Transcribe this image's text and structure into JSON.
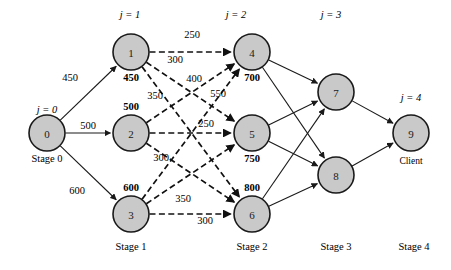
{
  "diagram": {
    "type": "network-flow-graph",
    "background_color": "#ffffff",
    "node_fill_color": "#c9c9c9",
    "node_stroke_color": "#1a1a1a",
    "edge_color": "#111111",
    "stage_headers": [
      {
        "id": "j0",
        "text": "j = 0",
        "x": 47,
        "y": 113
      },
      {
        "id": "j1",
        "text": "j = 1",
        "x": 130,
        "y": 18
      },
      {
        "id": "j2",
        "text": "j = 2",
        "x": 236,
        "y": 18
      },
      {
        "id": "j3",
        "text": "j = 3",
        "x": 331,
        "y": 18
      },
      {
        "id": "j4",
        "text": "j = 4",
        "x": 411,
        "y": 101
      }
    ],
    "stage_footers": [
      {
        "id": "stage0",
        "text": "Stage 0",
        "x": 47,
        "y": 162
      },
      {
        "id": "stage1",
        "text": "Stage 1",
        "x": 131,
        "y": 250
      },
      {
        "id": "stage2",
        "text": "Stage 2",
        "x": 252,
        "y": 250
      },
      {
        "id": "stage3",
        "text": "Stage 3",
        "x": 336,
        "y": 250
      },
      {
        "id": "stage4",
        "text": "Stage 4",
        "x": 414,
        "y": 250
      }
    ],
    "client_label": {
      "text": "Client",
      "x": 411,
      "y": 164
    },
    "nodes": [
      {
        "id": "n0",
        "label": "0",
        "x": 47,
        "y": 133,
        "r": 18,
        "value": null,
        "value_pos": null
      },
      {
        "id": "n1",
        "label": "1",
        "x": 131,
        "y": 52,
        "r": 18,
        "value": "450",
        "value_pos": "below"
      },
      {
        "id": "n2",
        "label": "2",
        "x": 131,
        "y": 133,
        "r": 18,
        "value": "500",
        "value_pos": "above"
      },
      {
        "id": "n3",
        "label": "3",
        "x": 131,
        "y": 214,
        "r": 18,
        "value": "600",
        "value_pos": "above"
      },
      {
        "id": "n4",
        "label": "4",
        "x": 252,
        "y": 52,
        "r": 18,
        "value": "700",
        "value_pos": "below"
      },
      {
        "id": "n5",
        "label": "5",
        "x": 252,
        "y": 133,
        "r": 18,
        "value": "750",
        "value_pos": "below"
      },
      {
        "id": "n6",
        "label": "6",
        "x": 252,
        "y": 214,
        "r": 18,
        "value": "800",
        "value_pos": "above"
      },
      {
        "id": "n7",
        "label": "7",
        "x": 336,
        "y": 92,
        "r": 18,
        "value": null,
        "value_pos": null
      },
      {
        "id": "n8",
        "label": "8",
        "x": 336,
        "y": 175,
        "r": 18,
        "value": null,
        "value_pos": null
      },
      {
        "id": "n9",
        "label": "9",
        "x": 411,
        "y": 133,
        "r": 18,
        "value": null,
        "value_pos": null
      }
    ],
    "edges": [
      {
        "id": "e0-1",
        "from": "n0",
        "to": "n1",
        "style": "solid",
        "weight": "450",
        "label_x": 70,
        "label_y": 81
      },
      {
        "id": "e0-2",
        "from": "n0",
        "to": "n2",
        "style": "solid",
        "weight": "500",
        "label_x": 88,
        "label_y": 129
      },
      {
        "id": "e0-3",
        "from": "n0",
        "to": "n3",
        "style": "solid",
        "weight": "600",
        "label_x": 77,
        "label_y": 194
      },
      {
        "id": "e1-4",
        "from": "n1",
        "to": "n4",
        "style": "dashed",
        "weight": "250",
        "label_x": 192,
        "label_y": 38
      },
      {
        "id": "e1-5",
        "from": "n1",
        "to": "n5",
        "style": "dashed",
        "weight": "300",
        "label_x": 175,
        "label_y": 63
      },
      {
        "id": "e1-6",
        "from": "n1",
        "to": "n6",
        "style": "dashed",
        "weight": "400",
        "label_x": 194,
        "label_y": 82
      },
      {
        "id": "e2-4",
        "from": "n2",
        "to": "n4",
        "style": "dashed",
        "weight": "350",
        "label_x": 155,
        "label_y": 99
      },
      {
        "id": "e2-5",
        "from": "n2",
        "to": "n5",
        "style": "dashed",
        "weight": "250",
        "label_x": 206,
        "label_y": 127
      },
      {
        "id": "e2-6",
        "from": "n2",
        "to": "n6",
        "style": "dashed",
        "weight": "300",
        "label_x": 161,
        "label_y": 161
      },
      {
        "id": "e3-4",
        "from": "n3",
        "to": "n4",
        "style": "dashed",
        "weight": "550",
        "label_x": 218,
        "label_y": 97
      },
      {
        "id": "e3-5",
        "from": "n3",
        "to": "n5",
        "style": "dashed",
        "weight": "350",
        "label_x": 183,
        "label_y": 202
      },
      {
        "id": "e3-6",
        "from": "n3",
        "to": "n6",
        "style": "dashed",
        "weight": "300",
        "label_x": 205,
        "label_y": 224
      },
      {
        "id": "e4-7",
        "from": "n4",
        "to": "n7",
        "style": "solid",
        "weight": null
      },
      {
        "id": "e4-8",
        "from": "n4",
        "to": "n8",
        "style": "solid",
        "weight": null
      },
      {
        "id": "e5-7",
        "from": "n5",
        "to": "n7",
        "style": "solid",
        "weight": null
      },
      {
        "id": "e5-8",
        "from": "n5",
        "to": "n8",
        "style": "solid",
        "weight": null
      },
      {
        "id": "e6-7",
        "from": "n6",
        "to": "n7",
        "style": "solid",
        "weight": null
      },
      {
        "id": "e6-8",
        "from": "n6",
        "to": "n8",
        "style": "solid",
        "weight": null
      },
      {
        "id": "e7-9",
        "from": "n7",
        "to": "n9",
        "style": "solid",
        "weight": null
      },
      {
        "id": "e8-9",
        "from": "n8",
        "to": "n9",
        "style": "solid",
        "weight": null
      }
    ]
  }
}
